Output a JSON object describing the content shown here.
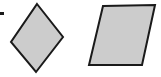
{
  "figure": {
    "width": 161,
    "height": 77,
    "background_color": "#ffffff",
    "title": "Two quadrilaterals: a rotated square and a parallelogram",
    "shape_fill_color": "#cccccc",
    "shape_stroke_color": "#1a1a1a",
    "shape_stroke_width": 2,
    "shapes": [
      {
        "id": "rotated-square",
        "name": "rotated-square",
        "label": "Rotated square (diamond)",
        "type": "quadrilateral",
        "sides": 4,
        "points": "37,4 63,37 36,72 11,42",
        "fill": "#cccccc",
        "stroke": "#1a1a1a",
        "stroke_width": 2
      },
      {
        "id": "parallelogram",
        "name": "parallelogram",
        "label": "Parallelogram",
        "type": "quadrilateral",
        "sides": 4,
        "points": "103,6 155,5 142,65 89,65",
        "fill": "#cccccc",
        "stroke": "#1a1a1a",
        "stroke_width": 2
      }
    ],
    "marks": [
      {
        "id": "edge-tick",
        "name": "edge-tick-mark",
        "label": "Tick mark at left edge",
        "x": 0,
        "y": 12,
        "width": 4,
        "height": 3,
        "color": "#1a1a1a"
      }
    ]
  }
}
